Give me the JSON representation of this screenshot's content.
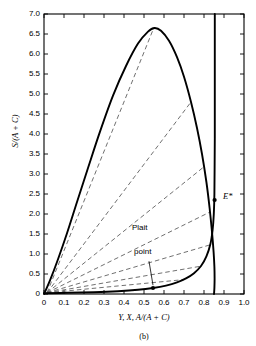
{
  "figure": {
    "caption": "(b)"
  },
  "chart_data": {
    "type": "line",
    "title": "",
    "xlabel": "Y, X, A/(A + C)",
    "ylabel": "S/(A + C)",
    "xlim": [
      0,
      1.0
    ],
    "ylim": [
      0,
      7.0
    ],
    "grid": false,
    "legend": "none",
    "x_ticks": [
      0,
      0.1,
      0.2,
      0.3,
      0.4,
      0.5,
      0.6,
      0.7,
      0.8,
      0.9,
      1.0
    ],
    "x_tick_labels": [
      "0",
      "0.1",
      "0.2",
      "0.3",
      "0.4",
      "0.5",
      "0.6",
      "0.7",
      "0.8",
      "0.9",
      "1.0"
    ],
    "y_ticks": [
      0,
      0.5,
      1.0,
      1.5,
      2.0,
      2.5,
      3.0,
      3.5,
      4.0,
      4.5,
      5.0,
      5.5,
      6.0,
      6.5,
      7.0
    ],
    "y_tick_labels": [
      "0",
      "0.5",
      "1.0",
      "1.5",
      "2.0",
      "2.5",
      "3.0",
      "3.5",
      "4.0",
      "4.5",
      "5.0",
      "5.5",
      "6.0",
      "6.5",
      "7.0"
    ],
    "series": [
      {
        "name": "binodal-curve",
        "style": "solid",
        "points": [
          [
            0.0,
            0.0
          ],
          [
            0.03,
            0.34
          ],
          [
            0.07,
            0.87
          ],
          [
            0.115,
            1.52
          ],
          [
            0.165,
            2.3
          ],
          [
            0.22,
            3.15
          ],
          [
            0.28,
            4.06
          ],
          [
            0.345,
            4.96
          ],
          [
            0.41,
            5.7
          ],
          [
            0.47,
            6.26
          ],
          [
            0.52,
            6.56
          ],
          [
            0.553,
            6.65
          ],
          [
            0.585,
            6.58
          ],
          [
            0.625,
            6.33
          ],
          [
            0.665,
            5.92
          ],
          [
            0.7,
            5.43
          ],
          [
            0.735,
            4.8
          ],
          [
            0.765,
            4.15
          ],
          [
            0.79,
            3.5
          ],
          [
            0.812,
            2.8
          ],
          [
            0.828,
            2.15
          ],
          [
            0.84,
            1.55
          ],
          [
            0.848,
            1.05
          ],
          [
            0.852,
            0.68
          ],
          [
            0.853,
            0.38
          ],
          [
            0.852,
            0.15
          ],
          [
            0.85,
            0.0
          ]
        ]
      },
      {
        "name": "lower-binodal-branch",
        "style": "solid",
        "points": [
          [
            0.0,
            0.02
          ],
          [
            0.12,
            0.03
          ],
          [
            0.25,
            0.045
          ],
          [
            0.37,
            0.07
          ],
          [
            0.47,
            0.105
          ],
          [
            0.545,
            0.15
          ],
          [
            0.61,
            0.21
          ],
          [
            0.665,
            0.29
          ],
          [
            0.71,
            0.39
          ],
          [
            0.75,
            0.52
          ],
          [
            0.785,
            0.7
          ],
          [
            0.812,
            0.94
          ],
          [
            0.832,
            1.25
          ],
          [
            0.843,
            1.6
          ],
          [
            0.849,
            2.0
          ],
          [
            0.852,
            2.5
          ],
          [
            0.853,
            3.1
          ],
          [
            0.854,
            3.9
          ],
          [
            0.854,
            4.8
          ],
          [
            0.854,
            5.9
          ],
          [
            0.854,
            7.0
          ]
        ]
      }
    ],
    "tie_lines": [
      {
        "name": "tie-line-1",
        "style": "dashed",
        "from": [
          0.015,
          0.03
        ],
        "to": [
          0.548,
          6.64
        ]
      },
      {
        "name": "tie-line-2",
        "style": "dashed",
        "from": [
          0.015,
          0.03
        ],
        "to": [
          0.735,
          4.8
        ]
      },
      {
        "name": "tie-line-3",
        "style": "dashed",
        "from": [
          0.015,
          0.03
        ],
        "to": [
          0.8,
          3.18
        ]
      },
      {
        "name": "tie-line-4",
        "style": "dashed",
        "from": [
          0.015,
          0.03
        ],
        "to": [
          0.83,
          2.05
        ]
      },
      {
        "name": "tie-line-5",
        "style": "dashed",
        "from": [
          0.015,
          0.03
        ],
        "to": [
          0.845,
          1.25
        ]
      },
      {
        "name": "tie-line-6",
        "style": "dashed",
        "from": [
          0.015,
          0.03
        ],
        "to": [
          0.79,
          0.7
        ]
      },
      {
        "name": "tie-line-7",
        "style": "dashed",
        "from": [
          0.015,
          0.03
        ],
        "to": [
          0.7,
          0.36
        ]
      }
    ],
    "points": [
      {
        "name": "plait-point",
        "label": "Plait point",
        "x": 0.545,
        "y": 0.15
      },
      {
        "name": "e-star-point",
        "label": "E*",
        "x": 0.853,
        "y": 2.35
      }
    ],
    "annotations": [
      {
        "name": "plait-point-label",
        "text": "Plait",
        "x": 0.44,
        "y": 1.62
      },
      {
        "name": "plait-point-label-2",
        "text": "point",
        "x": 0.45,
        "y": 1.02
      },
      {
        "name": "e-star-label",
        "text": "E*",
        "x": 0.895,
        "y": 2.42
      }
    ]
  }
}
